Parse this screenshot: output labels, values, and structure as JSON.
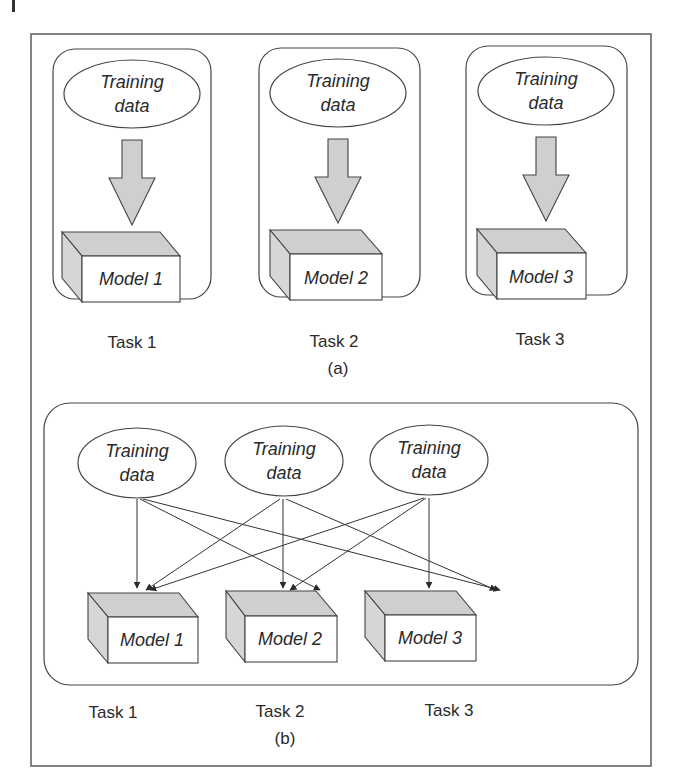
{
  "figure": {
    "panel_a": {
      "caption": "(a)",
      "tasks": [
        {
          "task_label": "Task 1",
          "data_label_line1": "Training",
          "data_label_line2": "data",
          "model_label": "Model 1"
        },
        {
          "task_label": "Task 2",
          "data_label_line1": "Training",
          "data_label_line2": "data",
          "model_label": "Model 2"
        },
        {
          "task_label": "Task 3",
          "data_label_line1": "Training",
          "data_label_line2": "data",
          "model_label": "Model 3"
        }
      ]
    },
    "panel_b": {
      "caption": "(b)",
      "data_sources": [
        {
          "line1": "Training",
          "line2": "data"
        },
        {
          "line1": "Training",
          "line2": "data"
        },
        {
          "line1": "Training",
          "line2": "data"
        }
      ],
      "models": [
        {
          "label": "Model 1"
        },
        {
          "label": "Model 2"
        },
        {
          "label": "Model 3"
        }
      ],
      "task_labels": [
        "Task 1",
        "Task 2",
        "Task 3"
      ]
    },
    "colors": {
      "stroke": "#3a3a3a",
      "fill_gray": "#cfcfcf",
      "background": "#ffffff"
    }
  }
}
